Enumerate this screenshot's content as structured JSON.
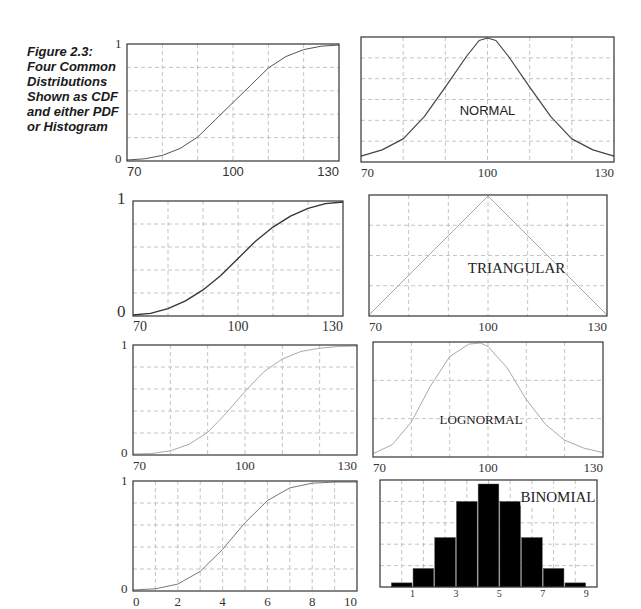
{
  "figure": {
    "caption": "Figure 2.3: Four Common Distributions Shown as CDF and either PDF or Histogram"
  },
  "chart_data": [
    {
      "id": "normal-cdf",
      "type": "line",
      "title": "",
      "row": 1,
      "column": 1,
      "x_ticks": [
        "70",
        "100",
        "130"
      ],
      "y_ticks": [
        "0",
        "1"
      ],
      "xlim": [
        70,
        130
      ],
      "ylim": [
        0,
        1
      ],
      "grid": true,
      "x": [
        70,
        75,
        80,
        85,
        90,
        95,
        100,
        105,
        110,
        115,
        120,
        125,
        130
      ],
      "values": [
        0.0,
        0.01,
        0.04,
        0.1,
        0.2,
        0.35,
        0.5,
        0.65,
        0.8,
        0.9,
        0.96,
        0.99,
        1.0
      ]
    },
    {
      "id": "normal-pdf",
      "type": "line",
      "title": "NORMAL",
      "row": 1,
      "column": 2,
      "x_ticks": [
        "70",
        "100",
        "130"
      ],
      "xlim": [
        70,
        130
      ],
      "ylim": [
        0,
        1
      ],
      "grid": true,
      "x": [
        70,
        75,
        80,
        85,
        90,
        95,
        98,
        100,
        102,
        105,
        110,
        115,
        120,
        125,
        130
      ],
      "values": [
        0.04,
        0.09,
        0.18,
        0.36,
        0.6,
        0.85,
        0.98,
        1.0,
        0.98,
        0.85,
        0.6,
        0.36,
        0.18,
        0.09,
        0.04
      ]
    },
    {
      "id": "triangular-cdf",
      "type": "line",
      "title": "",
      "row": 2,
      "column": 1,
      "x_ticks": [
        "70",
        "100",
        "130"
      ],
      "y_ticks": [
        "0",
        "1"
      ],
      "xlim": [
        70,
        130
      ],
      "ylim": [
        0,
        1
      ],
      "grid": true,
      "x": [
        70,
        75,
        80,
        85,
        90,
        95,
        100,
        105,
        110,
        115,
        120,
        125,
        130
      ],
      "values": [
        0.0,
        0.014,
        0.056,
        0.125,
        0.222,
        0.347,
        0.5,
        0.653,
        0.778,
        0.875,
        0.944,
        0.986,
        1.0
      ]
    },
    {
      "id": "triangular-pdf",
      "type": "line",
      "title": "TRIANGULAR",
      "row": 2,
      "column": 2,
      "x_ticks": [
        "70",
        "100",
        "130"
      ],
      "xlim": [
        70,
        130
      ],
      "ylim": [
        0,
        1
      ],
      "grid": true,
      "x": [
        70,
        100,
        130
      ],
      "values": [
        0.0,
        1.0,
        0.0
      ]
    },
    {
      "id": "lognormal-cdf",
      "type": "line",
      "title": "",
      "row": 3,
      "column": 1,
      "x_ticks": [
        "70",
        "100",
        "130"
      ],
      "y_ticks": [
        "0",
        "1"
      ],
      "xlim": [
        70,
        130
      ],
      "ylim": [
        0,
        1
      ],
      "grid": true,
      "x": [
        70,
        75,
        80,
        85,
        90,
        95,
        100,
        105,
        110,
        115,
        120,
        125,
        130
      ],
      "values": [
        0.0,
        0.005,
        0.03,
        0.09,
        0.2,
        0.38,
        0.58,
        0.76,
        0.88,
        0.95,
        0.98,
        0.995,
        1.0
      ]
    },
    {
      "id": "lognormal-pdf",
      "type": "line",
      "title": "LOGNORMAL",
      "row": 3,
      "column": 2,
      "x_ticks": [
        "70",
        "100",
        "130"
      ],
      "xlim": [
        70,
        130
      ],
      "ylim": [
        0,
        1
      ],
      "grid": true,
      "x": [
        70,
        75,
        80,
        85,
        90,
        95,
        98,
        100,
        105,
        110,
        115,
        120,
        125,
        130
      ],
      "values": [
        0.02,
        0.1,
        0.3,
        0.62,
        0.88,
        0.99,
        1.0,
        0.97,
        0.78,
        0.5,
        0.28,
        0.14,
        0.07,
        0.03
      ]
    },
    {
      "id": "binomial-cdf",
      "type": "line",
      "title": "",
      "row": 4,
      "column": 1,
      "x_ticks": [
        "0",
        "2",
        "4",
        "6",
        "8",
        "10"
      ],
      "y_ticks": [
        "0",
        "1"
      ],
      "xlim": [
        0,
        10
      ],
      "ylim": [
        0,
        1
      ],
      "grid": true,
      "x": [
        0,
        1,
        2,
        3,
        4,
        5,
        6,
        7,
        8,
        9,
        10
      ],
      "values": [
        0.0,
        0.011,
        0.055,
        0.172,
        0.377,
        0.623,
        0.828,
        0.945,
        0.989,
        0.999,
        1.0
      ]
    },
    {
      "id": "binomial-histogram",
      "type": "bar",
      "title": "BINOMIAL",
      "row": 4,
      "column": 2,
      "x_ticks": [
        "1",
        "3",
        "5",
        "7",
        "9"
      ],
      "categories": [
        "1",
        "2",
        "3",
        "4",
        "5",
        "6",
        "7",
        "8",
        "9"
      ],
      "values": [
        0.04,
        0.18,
        0.48,
        0.83,
        1.0,
        0.83,
        0.48,
        0.18,
        0.04
      ],
      "ylim": [
        0,
        1
      ],
      "grid": true
    }
  ]
}
